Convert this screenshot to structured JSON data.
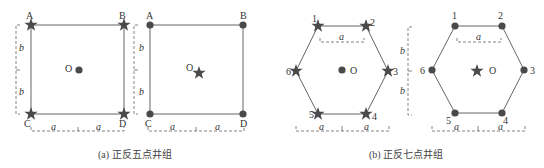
{
  "figure": {
    "panels": [
      {
        "id": "a-left",
        "shape": "square",
        "vertex_labels": [
          "A",
          "B",
          "C",
          "D"
        ],
        "vertex_marker": "star",
        "center_label": "O",
        "center_marker": "dot",
        "dim_labels": {
          "horizontal": [
            "a",
            "a"
          ],
          "vertical": [
            "b",
            "b"
          ]
        }
      },
      {
        "id": "a-right",
        "shape": "square",
        "vertex_labels": [
          "A",
          "B",
          "C",
          "D"
        ],
        "vertex_marker": "dot",
        "center_label": "O",
        "center_marker": "star",
        "dim_labels": {
          "horizontal": [
            "a",
            "a"
          ],
          "vertical": [
            "b",
            "b"
          ]
        }
      },
      {
        "id": "b-left",
        "shape": "hexagon",
        "vertex_labels": [
          "1",
          "2",
          "3",
          "4",
          "5",
          "6"
        ],
        "vertex_marker": "star",
        "center_label": "O",
        "center_marker": "dot",
        "dim_labels": {
          "top": "a",
          "bottom": [
            "a",
            "a"
          ],
          "vertical": [
            "b",
            "b"
          ]
        }
      },
      {
        "id": "b-right",
        "shape": "hexagon",
        "vertex_labels": [
          "1",
          "2",
          "3",
          "4",
          "5",
          "6"
        ],
        "vertex_marker": "dot",
        "center_label": "O",
        "center_marker": "star",
        "dim_labels": {
          "top": "a",
          "bottom": [
            "a",
            "a"
          ],
          "vertical": [
            "b",
            "b"
          ]
        }
      }
    ],
    "captions": {
      "a": "(a)  正反五点井组",
      "b": "(b)  正反七点井组"
    },
    "colors": {
      "edge": "#666666",
      "marker": "#4a4a4a",
      "dimension": "#777777"
    }
  }
}
